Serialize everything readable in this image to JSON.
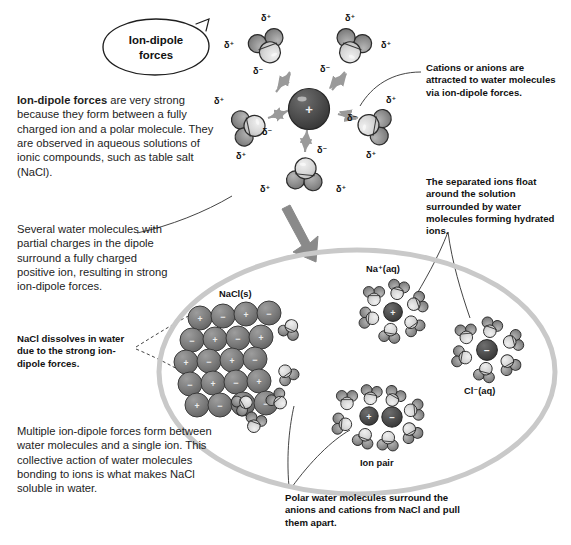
{
  "figure": {
    "topic": "Ion-dipole forces",
    "bubble_label": "Ion-dipole\nforces"
  },
  "body_text": {
    "intro_bold": "Ion-dipole forces",
    "intro_rest": " are very strong because they form between a fully charged ion and a polar molecule. They are observed in aqueous solutions of ionic compounds, such as table salt (NaCl).",
    "several_water": "Several water molecules with partial charges in the dipole surround a fully charged positive ion, resulting in strong ion-dipole forces.",
    "multiple_forces": "Multiple ion-dipole forces form between water molecules and a single ion. This collective action of water molecules bonding to ions is what makes NaCl soluble in water."
  },
  "callouts": {
    "cations_anions": "Cations or anions are attracted to water molecules via ion-dipole forces.",
    "separated_ions": "The separated ions float around the solution surrounded by water molecules forming hydrated ions.",
    "nacl_dissolves": "NaCl dissolves in water due to the strong ion-dipole forces.",
    "polar_water": "Polar water molecules surround the anions and cations from NaCl and pull them apart."
  },
  "species_labels": {
    "solid": "NaCl(s)",
    "sodium_aq": "Na⁺(aq)",
    "chloride_aq": "Cl⁻(aq)",
    "ion_pair": "Ion pair"
  },
  "charge_symbols": {
    "partial_positive": "δ⁺",
    "partial_negative": "δ⁻",
    "cation": "+",
    "anion": "−"
  },
  "top_complex": {
    "center_ion_charge": "+",
    "waters": [
      {
        "id": "water-upper-left",
        "dplus_a": "δ⁺",
        "dplus_b": "δ⁺",
        "dminus": "δ⁻"
      },
      {
        "id": "water-upper-right",
        "dplus_a": "δ⁺",
        "dplus_b": "δ⁺",
        "dminus": "δ⁻"
      },
      {
        "id": "water-left",
        "dplus_a": "δ⁺",
        "dplus_b": "δ⁺",
        "dminus": "δ⁻"
      },
      {
        "id": "water-right",
        "dplus_a": "δ⁺",
        "dplus_b": "δ⁺",
        "dminus": "δ⁻"
      },
      {
        "id": "water-bottom",
        "dplus_a": "δ⁺",
        "dplus_b": "δ⁺",
        "dminus": "δ⁻"
      }
    ]
  },
  "crystal": {
    "rows": 5,
    "cols": 5,
    "pattern": [
      [
        "+",
        "−",
        "+",
        "−",
        "+"
      ],
      [
        "−",
        "+",
        "−",
        "+",
        "−"
      ],
      [
        "+",
        "−",
        "+",
        "−",
        "+"
      ],
      [
        "−",
        "+",
        "−",
        "+",
        "−"
      ],
      [
        "+",
        "−",
        "+",
        "−",
        "+"
      ]
    ]
  },
  "colors": {
    "oxygen_light": "#d2d2d2",
    "hydrogen_dark": "#8e8e8e",
    "ion_dark": "#4a4a4a",
    "lattice_gray": "#7b7b7b",
    "outline": "#2b2b2b",
    "solution_ring": "#c9c9c9",
    "arrow_gray": "#8a8a8a",
    "leader_line": "#3a3a3a",
    "text": "#1d1d1d"
  }
}
